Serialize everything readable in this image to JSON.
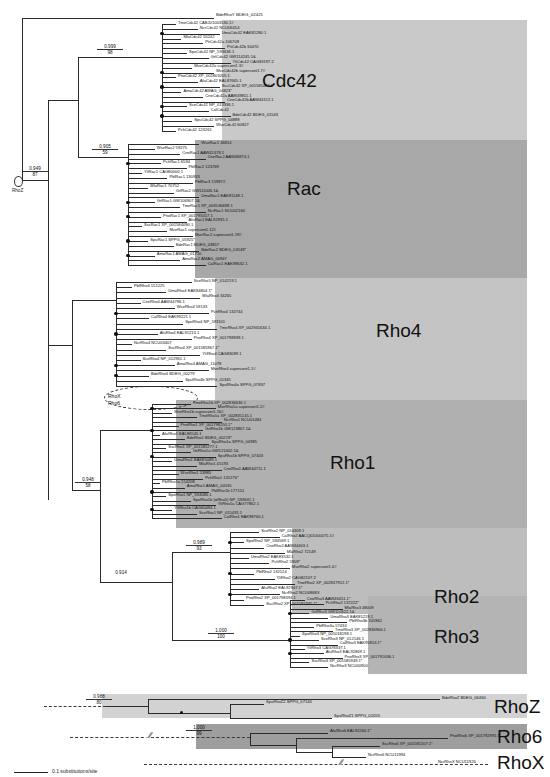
{
  "figure": {
    "type": "phylogenetic-tree",
    "scale_bar": {
      "length_label": "0.1 substitutions/site"
    },
    "root_label": "RhoZ",
    "root_support": {
      "posterior": "0.949",
      "bootstrap": "87"
    },
    "outgroup_tip": "BdeRhoY BDEG_02421",
    "inner_annotations": [
      {
        "name": "RhoX",
        "label": "RhoX"
      },
      {
        "name": "Rho6",
        "label": "Rho6"
      }
    ]
  },
  "clades": [
    {
      "name": "Cdc42",
      "label": "Cdc42",
      "color": "#c9c9c9",
      "support": {
        "posterior": "0.999",
        "bootstrap": "98"
      },
      "tips": [
        "TmeCdc42 CABJ01003530.1#",
        "NcrCdc42 NCU06454",
        "UmaCdc42 EAK81280.1",
        "MlaCdc42 55242",
        "PtiCdc42a 106709",
        "PtiCdc42b 34470",
        "SpoCdc42 NP_593636.1",
        "GrlCdc42 GW114245.1&",
        "YliCdc42 CAG83197.2",
        "MveCdc42a supercont1.3#",
        "MveCdc42b supercont1.7#",
        "PnoCdc42 XP_001803205.1",
        "AfuCdc42 EAL87665.1",
        "SscCdc42 XP_001585487.1",
        "AmaCdc42 AMAG_04823*",
        "CneCdc42a AAW49811.1",
        "CneCdc42b AAW44152.1",
        "SceCdc42 NP_013336.1",
        "CalCdc42",
        "BdeCdc42 BDEG_01543",
        "SpuCdc42 SPPG_04889",
        "WseCdc42 60827",
        "PchCdc42 123261"
      ]
    },
    {
      "name": "Rac",
      "label": "Rac",
      "color": "#a8a8a8",
      "support": {
        "posterior": "0.905",
        "bootstrap": "59"
      },
      "tips": [
        "WseRac1 46814",
        "WseRac2 59275",
        "CneRac1 AAW42478.1",
        "CneRac2 AAW46874.1",
        "PchRac1 6594",
        "PblRac2 123789",
        "YliRac1 CAG80000.1",
        "PblRac1 130933",
        "PblRac3 159872",
        "MlaRac1 70752",
        "GrlRac2 GW111006.1&",
        "UmaRac1 EAK81148.1",
        "GrlRac1 GW106907.1&",
        "TmeRac1 XP_003536698.1",
        "NcrRac1 NCU02160",
        "PnoRac1 XP_001791017.1",
        "AfuRac1 EAL92935.1",
        "SscRac1 XP_001584090.1",
        "MveRac1 supercont1.12#",
        "MveRac2 supercont1.19#",
        "SpuRac1 SPPG_05925*",
        "BdeRac1 BDEG_03857",
        "BdeRac2 BDEG_03149*",
        "AmaRac1 AMAG_01710",
        "AmaRac2 AMAG_00947",
        "CalRac1 EAK99632.1"
      ]
    },
    {
      "name": "Rho4",
      "label": "Rho4",
      "color": "#c4c4c4",
      "support": {
        "posterior": "",
        "bootstrap": ""
      },
      "tips": [
        "SceRho5 NP_014219.1",
        "PblRho4 151225",
        "UmaRho4 EAK84804.1*",
        "MlaRho4 34265",
        "CneRho4 AAW44796.1",
        "WseRho4 59133",
        "PchRho4 132744",
        "CalRho4 EAK99221.1",
        "SpoRho4 NP_593101",
        "TmeRho4 XP_002941634.1",
        "AfuRho4 EAL91213.1",
        "PnoRho4 XP_001798939.1",
        "NcrRho4 NCU03407",
        "SscRho4 XP_001585967.1*",
        "YliRho4 CAG83099.1",
        "SceRho4 NP_012961.1",
        "AmaRho4 AMAG_11078",
        "MveRho4 supercont1.1#",
        "BdeRho4 BDEG_00279",
        "SpuRho4b SPPG_01345",
        "SpuRho4a SPPG_07837"
      ]
    },
    {
      "name": "Rho1",
      "label": "Rho1",
      "color": "#b0b0b0",
      "support": {
        "posterior": "0.948",
        "bootstrap": "58"
      },
      "tips": [
        "TmeRho1b XP_002836636.1",
        "MveRho1a supercont1.2#",
        "MveRho1b supercont1.16#",
        "TmeRho1a XP_002835145.1",
        "NcrRho1 NCU01484",
        "PnoRho1 XP_001798250.1*",
        "GrlRho1b GW123867.1&",
        "AfuRho1 EAL86545.1",
        "BdeRho1 BDEG_00219*",
        "SpuRho1a SPPG_04985",
        "SscRho1 XP_001585277.1",
        "GrlRho1a GW121402.1&",
        "SpuRho1b SPPG_07403",
        "UmaRho1 EAK85089.1",
        "MlaRho1 45193",
        "CneRho1 AAW44711.1",
        "WseRho1 53985",
        "PchRho1 131276*",
        "PblRho1a 154208",
        "AmaRho1 AMAG_00535",
        "PblRho1b 177151",
        "SpoRho1 NP_594086.1",
        "SpoRho1b (=Rho5) NP_593631.1",
        "YliRho1a CAG77862.1",
        "YliRho1b CAG60494.1",
        "SceRho1 NP_015491.1",
        "CalRho1 EAK98760.1"
      ]
    },
    {
      "name": "Rho2",
      "label": "Rho2",
      "color": "#bdbdbd",
      "support": {
        "posterior": "0.989",
        "bootstrap": "93"
      },
      "tips": [
        "SceRho2 NP_014309.1",
        "CalRho2 AACQ01000075.1#",
        "SpoRho2 NP_594569.1",
        "CneRho2 AAW44403.1",
        "MlaRho2 72149",
        "UmaRho2 EAK83532.1",
        "PchRho2 5909*",
        "MveRho2 supercont1.4#",
        "PblRho2 132124",
        "YliRho2 CAG82107.2",
        "TmeRho2 XP_002837912.1*",
        "AfuRho2 EAL92947.1*",
        "NcrRho2 NCU08683",
        "PnoRho2 XP_001798394.1",
        "SscRho2 XP_001592335.1*"
      ]
    },
    {
      "name": "Rho3",
      "label": "Rho3",
      "color": "#b4b4b4",
      "support": {
        "posterior": "1.000",
        "bootstrap": "100"
      },
      "tips": [
        "CneRho3 AAW46051.1*",
        "PchRho3 137222*",
        "MlaRho3 48009",
        "GrlRho3 GW110622.1&",
        "UmaRho3 EAK85219.1",
        "PblRho3b 105962",
        "PblRho3a 57434",
        "TmeRho3 XP_002836966.1",
        "SpoRho3 NP_001018198.1",
        "SceRho3 NP_012146.1",
        "CalRho3 EAK95853.1*",
        "YliRho3 CAG78337.1",
        "AfuRho3 EAL92869.1",
        "PnoRho3 XP_001791636.1",
        "SscRho3 XP_001585949.1*",
        "NcrRho3 NCU00900"
      ]
    },
    {
      "name": "RhoZ",
      "label": "RhoZ",
      "color": "#d2d2d2",
      "support": {
        "posterior": "0.988",
        "bootstrap": "80"
      },
      "tips": [
        "SpuRhoZ2 SPPG_07140",
        "SpuRhoZ1 SPPG_02053",
        "BdeRhoZ BDEG_06460"
      ]
    },
    {
      "name": "Rho6",
      "label": "Rho6",
      "color": "#9e9e9e",
      "support": {
        "posterior": "1.000",
        "bootstrap": "99"
      },
      "tips": [
        "AfuRho6 EAL92260.1*",
        "PnoRho6 XP_001792991.1",
        "SscRho6 XP_001581107.1*",
        "NcrRho6 NCU11994"
      ]
    },
    {
      "name": "RhoX",
      "label": "RhoX",
      "color": "transparent",
      "support": {
        "posterior": "",
        "bootstrap": ""
      },
      "tips": [
        "NcrRhoX NCU11926"
      ]
    }
  ],
  "chart_data": {
    "type": "tree",
    "title": "",
    "scale": "0.1 substitutions/site",
    "node_supports": [
      {
        "node": "root",
        "posterior": "0.949",
        "bootstrap": "87"
      },
      {
        "node": "cdc42",
        "posterior": "0.999",
        "bootstrap": "98"
      },
      {
        "node": "rac",
        "posterior": "0.905",
        "bootstrap": "59"
      },
      {
        "node": "rho1",
        "posterior": "0.948",
        "bootstrap": "58"
      },
      {
        "node": "rho2",
        "posterior": "0.989",
        "bootstrap": "93"
      },
      {
        "node": "rho2-rho3",
        "posterior": "0.914",
        "bootstrap": ""
      },
      {
        "node": "rho3",
        "posterior": "1.000",
        "bootstrap": "100"
      },
      {
        "node": "rhoz",
        "posterior": "0.988",
        "bootstrap": "80"
      },
      {
        "node": "rho6",
        "posterior": "1.000",
        "bootstrap": "99"
      }
    ]
  }
}
